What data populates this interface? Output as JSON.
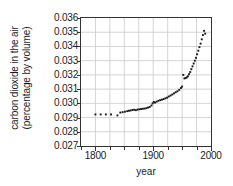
{
  "chart_data": {
    "type": "scatter",
    "title": "",
    "xlabel": "year",
    "ylabel": "carbon dioxide in the air (percentage by volume)",
    "ylabel_line1": "carbon dioxide in the air",
    "ylabel_line2": "(percentage by volume)",
    "xlim": [
      1775,
      2000
    ],
    "ylim": [
      0.027,
      0.036
    ],
    "grid": true,
    "legend": "none",
    "x_major_ticks": [
      1800,
      1900,
      2000
    ],
    "x_major_tick_labels": [
      "1800",
      "1900",
      "2000"
    ],
    "x_minor_tick_step": 25,
    "y_ticks": [
      0.027,
      0.028,
      0.029,
      0.03,
      0.031,
      0.032,
      0.033,
      0.034,
      0.035,
      0.036
    ],
    "y_tick_labels": [
      "0.027",
      "0.028",
      "0.029",
      "0.030",
      "0.031",
      "0.032",
      "0.033",
      "0.034",
      "0.035",
      "0.036"
    ],
    "marker": "square",
    "marker_color": "#1a1a1a",
    "grid_color": "#c9c9c9",
    "frame_color": "#333333",
    "x": [
      1800,
      1809,
      1818,
      1827,
      1838,
      1843,
      1847,
      1851,
      1855,
      1858,
      1861,
      1864,
      1867,
      1870,
      1873,
      1876,
      1879,
      1882,
      1885,
      1888,
      1891,
      1894,
      1897,
      1899,
      1901,
      1903,
      1906,
      1909,
      1912,
      1915,
      1918,
      1921,
      1924,
      1927,
      1930,
      1933,
      1936,
      1939,
      1942,
      1945,
      1948,
      1950,
      1952,
      1954,
      1956,
      1958,
      1960,
      1962,
      1964,
      1966,
      1968,
      1970,
      1972,
      1974,
      1976,
      1978,
      1980,
      1982,
      1984,
      1986,
      1988,
      1990
    ],
    "y": [
      0.02922,
      0.02922,
      0.02922,
      0.02922,
      0.02915,
      0.02935,
      0.02938,
      0.02941,
      0.02945,
      0.02948,
      0.0295,
      0.02953,
      0.02955,
      0.02952,
      0.02956,
      0.02958,
      0.0296,
      0.02962,
      0.02963,
      0.02966,
      0.0297,
      0.02975,
      0.02985,
      0.03,
      0.0301,
      0.03005,
      0.03012,
      0.03018,
      0.03022,
      0.03026,
      0.0303,
      0.03035,
      0.0304,
      0.03048,
      0.03055,
      0.03062,
      0.0307,
      0.03078,
      0.03085,
      0.03095,
      0.03108,
      0.03118,
      0.032,
      0.03175,
      0.03178,
      0.03182,
      0.0319,
      0.03205,
      0.0322,
      0.0324,
      0.0326,
      0.0328,
      0.033,
      0.0332,
      0.03345,
      0.0337,
      0.03395,
      0.0342,
      0.0345,
      0.0348,
      0.0351,
      0.0349
    ]
  }
}
